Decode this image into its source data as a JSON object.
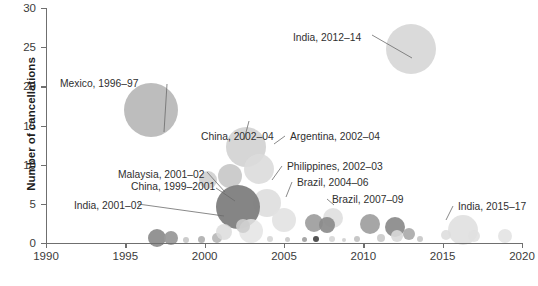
{
  "chart_data": {
    "type": "scatter",
    "title": "",
    "xlabel": "",
    "ylabel": "Number of cancellations",
    "xlim": [
      1990,
      2020
    ],
    "ylim": [
      0,
      30
    ],
    "xticks": [
      "1990",
      "1995",
      "2000",
      "2005",
      "2010",
      "2015",
      "2020"
    ],
    "yticks": [
      "0",
      "5",
      "10",
      "15",
      "20",
      "25",
      "30"
    ],
    "grid": false,
    "legend": "none",
    "note": "Bubble chart; bubble area encodes magnitude, x = year, y = number of cancellations",
    "points": [
      {
        "label": "Mexico, 1996–97",
        "x": 1996.6,
        "y": 17.0,
        "r": 27,
        "color": "#b9b9b9",
        "opacity": 0.95
      },
      {
        "label": "India, 2012–14",
        "x": 2013.0,
        "y": 24.8,
        "r": 25,
        "color": "#d8d8d8",
        "opacity": 0.95
      },
      {
        "label": "China, 2002–04",
        "x": 2002.6,
        "y": 12.3,
        "r": 20,
        "color": "#d2d2d2",
        "opacity": 0.92
      },
      {
        "label": "Argentina, 2002–04",
        "x": 2003.4,
        "y": 9.5,
        "r": 15,
        "color": "#dcdcdc",
        "opacity": 0.9
      },
      {
        "label": "Malaysia, 2001–02",
        "x": 2001.6,
        "y": 8.6,
        "r": 12,
        "color": "#c7c7c7",
        "opacity": 0.9
      },
      {
        "label": "China, 1999–2001",
        "x": 2000.2,
        "y": 8.0,
        "r": 9,
        "color": "#cfcfcf",
        "opacity": 0.9
      },
      {
        "label": "Philippines, 2002–03",
        "x": 2003.9,
        "y": 5.1,
        "r": 14,
        "color": "#dedede",
        "opacity": 0.9
      },
      {
        "label": "Brazil, 2004–06",
        "x": 2005.0,
        "y": 3.0,
        "r": 12,
        "color": "#e2e2e2",
        "opacity": 0.9
      },
      {
        "label": "Brazil, 2007–09",
        "x": 2008.1,
        "y": 3.2,
        "r": 10,
        "color": "#dfdfdf",
        "opacity": 0.9
      },
      {
        "label": "India, 2001–02",
        "x": 2002.1,
        "y": 4.6,
        "r": 22,
        "color": "#7e7e7e",
        "opacity": 0.95
      },
      {
        "label": "India, 2015–17",
        "x": 2016.3,
        "y": 1.7,
        "r": 15,
        "color": "#e0e0e0",
        "opacity": 0.9
      },
      {
        "label": "",
        "x": 1997.0,
        "y": 0.6,
        "r": 9,
        "color": "#8e8e8e",
        "opacity": 0.95
      },
      {
        "label": "",
        "x": 1997.9,
        "y": 0.6,
        "r": 7,
        "color": "#9a9a9a",
        "opacity": 0.95
      },
      {
        "label": "",
        "x": 1998.8,
        "y": 0.4,
        "r": 3,
        "color": "#c6c6c6",
        "opacity": 0.9
      },
      {
        "label": "",
        "x": 1999.8,
        "y": 0.5,
        "r": 3.5,
        "color": "#aeaeae",
        "opacity": 0.9
      },
      {
        "label": "",
        "x": 2000.8,
        "y": 0.6,
        "r": 5,
        "color": "#b6b6b6",
        "opacity": 0.9
      },
      {
        "label": "",
        "x": 2001.2,
        "y": 1.4,
        "r": 8,
        "color": "#dcdcdc",
        "opacity": 0.85
      },
      {
        "label": "",
        "x": 2002.9,
        "y": 1.5,
        "r": 12,
        "color": "#e4e4e4",
        "opacity": 0.85
      },
      {
        "label": "",
        "x": 2002.4,
        "y": 2.2,
        "r": 7,
        "color": "#cdcdcd",
        "opacity": 0.9
      },
      {
        "label": "",
        "x": 2004.1,
        "y": 0.5,
        "r": 3,
        "color": "#d6d6d6",
        "opacity": 0.9
      },
      {
        "label": "",
        "x": 2005.2,
        "y": 0.5,
        "r": 2.5,
        "color": "#c9c9c9",
        "opacity": 0.9
      },
      {
        "label": "",
        "x": 2006.3,
        "y": 0.5,
        "r": 2.5,
        "color": "#9f9f9f",
        "opacity": 0.9
      },
      {
        "label": "",
        "x": 2007.0,
        "y": 0.5,
        "r": 3,
        "color": "#4a4a4a",
        "opacity": 0.95
      },
      {
        "label": "",
        "x": 2006.9,
        "y": 2.5,
        "r": 9,
        "color": "#9b9b9b",
        "opacity": 0.9
      },
      {
        "label": "",
        "x": 2007.7,
        "y": 2.3,
        "r": 8,
        "color": "#8b8b8b",
        "opacity": 0.92
      },
      {
        "label": "",
        "x": 2008.0,
        "y": 0.5,
        "r": 3,
        "color": "#d6d6d6",
        "opacity": 0.9
      },
      {
        "label": "",
        "x": 2008.8,
        "y": 0.4,
        "r": 2,
        "color": "#cfcfcf",
        "opacity": 0.9
      },
      {
        "label": "",
        "x": 2009.6,
        "y": 0.5,
        "r": 3,
        "color": "#c1c1c1",
        "opacity": 0.9
      },
      {
        "label": "",
        "x": 2010.4,
        "y": 2.4,
        "r": 10,
        "color": "#9e9e9e",
        "opacity": 0.92
      },
      {
        "label": "",
        "x": 2011.1,
        "y": 0.6,
        "r": 4,
        "color": "#cacaca",
        "opacity": 0.9
      },
      {
        "label": "",
        "x": 2012.0,
        "y": 2.1,
        "r": 10,
        "color": "#8a8a8a",
        "opacity": 0.92
      },
      {
        "label": "",
        "x": 2012.1,
        "y": 0.9,
        "r": 6,
        "color": "#d9d9d9",
        "opacity": 0.9
      },
      {
        "label": "",
        "x": 2012.9,
        "y": 1.2,
        "r": 6,
        "color": "#a8a8a8",
        "opacity": 0.9
      },
      {
        "label": "",
        "x": 2013.6,
        "y": 0.5,
        "r": 3,
        "color": "#c6c6c6",
        "opacity": 0.9
      },
      {
        "label": "",
        "x": 2015.2,
        "y": 1.0,
        "r": 5,
        "color": "#dddddd",
        "opacity": 0.88
      },
      {
        "label": "",
        "x": 2017.0,
        "y": 0.9,
        "r": 6,
        "color": "#e0e0e0",
        "opacity": 0.88
      },
      {
        "label": "",
        "x": 2018.9,
        "y": 0.9,
        "r": 7,
        "color": "#e3e3e3",
        "opacity": 0.88
      }
    ],
    "annotations": [
      {
        "name": "annot-mexico",
        "text": "Mexico, 1996–97",
        "tx": 60,
        "ty": 78,
        "lx": 167,
        "ly": 84,
        "px": 164,
        "py": 132
      },
      {
        "name": "annot-india-2012",
        "text": "India, 2012–14",
        "tx": 293,
        "ty": 32,
        "lx": 372,
        "ly": 35,
        "px": 412,
        "py": 58
      },
      {
        "name": "annot-china-2002",
        "text": "China, 2002–04",
        "tx": 201,
        "ty": 131,
        "lx": 244,
        "ly": 140,
        "px": 249,
        "py": 121
      },
      {
        "name": "annot-argentina",
        "text": "Argentina, 2002–04",
        "tx": 290,
        "ty": 131,
        "lx": 285,
        "ly": 136,
        "px": 274,
        "py": 144
      },
      {
        "name": "annot-philippines",
        "text": "Philippines, 2002–03",
        "tx": 287,
        "ty": 161,
        "lx": 282,
        "ly": 166,
        "px": 272,
        "py": 180
      },
      {
        "name": "annot-brazil-2004",
        "text": "Brazil, 2004–06",
        "tx": 297,
        "ty": 177,
        "lx": 292,
        "ly": 182,
        "px": 286,
        "py": 197
      },
      {
        "name": "annot-brazil-2007",
        "text": "Brazil, 2007–09",
        "tx": 332,
        "ty": 194,
        "lx": 327,
        "ly": 199,
        "px": 334,
        "py": 205
      },
      {
        "name": "annot-malaysia",
        "text": "Malaysia, 2001–02",
        "tx": 118,
        "ty": 169,
        "lx": 207,
        "ly": 172,
        "px": 225,
        "py": 192
      },
      {
        "name": "annot-china-1999",
        "text": "China, 1999–2001",
        "tx": 131,
        "ty": 181,
        "lx": 216,
        "ly": 188,
        "px": 235,
        "py": 201
      },
      {
        "name": "annot-india-2001",
        "text": "India, 2001–02",
        "tx": 74,
        "ty": 200,
        "lx": 138,
        "ly": 204,
        "px": 224,
        "py": 216
      },
      {
        "name": "annot-india-2015",
        "text": "India, 2015–17",
        "tx": 458,
        "ty": 201,
        "lx": 453,
        "ly": 206,
        "px": 446,
        "py": 220
      }
    ]
  }
}
